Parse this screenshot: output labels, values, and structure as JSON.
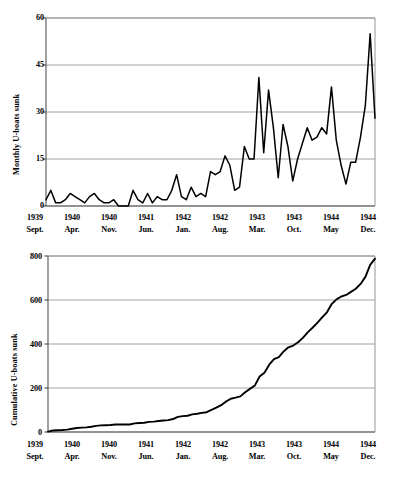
{
  "chart_data": [
    {
      "id": "monthly",
      "type": "line",
      "title": "",
      "xlabel": "",
      "ylabel": "Monthly U-boats sunk",
      "ylim": [
        0,
        60
      ],
      "yticks": [
        0,
        15,
        30,
        45,
        60
      ],
      "grid": true,
      "legend": "none",
      "xtick_labels": [
        {
          "year": "1939",
          "month": "Sept."
        },
        {
          "year": "1940",
          "month": "Apr."
        },
        {
          "year": "1940",
          "month": "Nov."
        },
        {
          "year": "1941",
          "month": "Jun."
        },
        {
          "year": "1942",
          "month": "Jan."
        },
        {
          "year": "1942",
          "month": "Aug."
        },
        {
          "year": "1943",
          "month": "Mar."
        },
        {
          "year": "1943",
          "month": "Oct."
        },
        {
          "year": "1944",
          "month": "May"
        },
        {
          "year": "1944",
          "month": "Dec."
        }
      ],
      "x": [
        "1939 Sept.",
        "1939 Oct.",
        "1939 Nov.",
        "1939 Dec.",
        "1940 Jan.",
        "1940 Feb.",
        "1940 Mar.",
        "1940 Apr.",
        "1940 May",
        "1940 Jun.",
        "1940 Jul.",
        "1940 Aug.",
        "1940 Sept.",
        "1940 Oct.",
        "1940 Nov.",
        "1940 Dec.",
        "1941 Jan.",
        "1941 Feb.",
        "1941 Mar.",
        "1941 Apr.",
        "1941 May",
        "1941 Jun.",
        "1941 Jul.",
        "1941 Aug.",
        "1941 Sept.",
        "1941 Oct.",
        "1941 Nov.",
        "1941 Dec.",
        "1942 Jan.",
        "1942 Feb.",
        "1942 Mar.",
        "1942 Apr.",
        "1942 May",
        "1942 Jun.",
        "1942 Jul.",
        "1942 Aug.",
        "1942 Sept.",
        "1942 Oct.",
        "1942 Nov.",
        "1942 Dec.",
        "1943 Jan.",
        "1943 Feb.",
        "1943 Mar.",
        "1943 Apr.",
        "1943 May",
        "1943 Jun.",
        "1943 Jul.",
        "1943 Aug.",
        "1943 Sept.",
        "1943 Oct.",
        "1943 Nov.",
        "1943 Dec.",
        "1944 Jan.",
        "1944 Feb.",
        "1944 Mar.",
        "1944 Apr.",
        "1944 May",
        "1944 Jun.",
        "1944 Jul.",
        "1944 Aug.",
        "1944 Sept.",
        "1944 Oct.",
        "1944 Nov.",
        "1944 Dec.",
        "1945 Jan.",
        "1945 Feb.",
        "1945 Mar.",
        "1945 Apr.",
        "1945 May"
      ],
      "values": [
        2,
        5,
        1,
        1,
        2,
        4,
        3,
        2,
        1,
        3,
        4,
        2,
        1,
        1,
        2,
        0,
        0,
        0,
        5,
        2,
        1,
        4,
        1,
        3,
        2,
        2,
        5,
        10,
        3,
        2,
        6,
        3,
        4,
        3,
        11,
        10,
        11,
        16,
        13,
        5,
        6,
        19,
        15,
        15,
        41,
        17,
        37,
        25,
        9,
        26,
        19,
        8,
        15,
        20,
        25,
        21,
        22,
        25,
        23,
        38,
        21,
        13,
        7,
        14,
        14,
        22,
        32,
        55,
        28
      ]
    },
    {
      "id": "cumulative",
      "type": "line",
      "title": "",
      "xlabel": "",
      "ylabel": "Cumulative U-boats sunk",
      "ylim": [
        0,
        800
      ],
      "yticks": [
        0,
        200,
        400,
        600,
        800
      ],
      "grid": true,
      "legend": "none",
      "xtick_labels": [
        {
          "year": "1939",
          "month": "Sept."
        },
        {
          "year": "1940",
          "month": "Apr."
        },
        {
          "year": "1940",
          "month": "Nov."
        },
        {
          "year": "1941",
          "month": "Jun."
        },
        {
          "year": "1942",
          "month": "Jan."
        },
        {
          "year": "1942",
          "month": "Aug."
        },
        {
          "year": "1943",
          "month": "Mar."
        },
        {
          "year": "1943",
          "month": "Oct."
        },
        {
          "year": "1944",
          "month": "May"
        },
        {
          "year": "1944",
          "month": "Dec."
        }
      ],
      "x": [
        "1939 Sept.",
        "1939 Oct.",
        "1939 Nov.",
        "1939 Dec.",
        "1940 Jan.",
        "1940 Feb.",
        "1940 Mar.",
        "1940 Apr.",
        "1940 May",
        "1940 Jun.",
        "1940 Jul.",
        "1940 Aug.",
        "1940 Sept.",
        "1940 Oct.",
        "1940 Nov.",
        "1940 Dec.",
        "1941 Jan.",
        "1941 Feb.",
        "1941 Mar.",
        "1941 Apr.",
        "1941 May",
        "1941 Jun.",
        "1941 Jul.",
        "1941 Aug.",
        "1941 Sept.",
        "1941 Oct.",
        "1941 Nov.",
        "1941 Dec.",
        "1942 Jan.",
        "1942 Feb.",
        "1942 Mar.",
        "1942 Apr.",
        "1942 May",
        "1942 Jun.",
        "1942 Jul.",
        "1942 Aug.",
        "1942 Sept.",
        "1942 Oct.",
        "1942 Nov.",
        "1942 Dec.",
        "1943 Jan.",
        "1943 Feb.",
        "1943 Mar.",
        "1943 Apr.",
        "1943 May",
        "1943 Jun.",
        "1943 Jul.",
        "1943 Aug.",
        "1943 Sept.",
        "1943 Oct.",
        "1943 Nov.",
        "1943 Dec.",
        "1944 Jan.",
        "1944 Feb.",
        "1944 Mar.",
        "1944 Apr.",
        "1944 May",
        "1944 Jun.",
        "1944 Jul.",
        "1944 Aug.",
        "1944 Sept.",
        "1944 Oct.",
        "1944 Nov.",
        "1944 Dec.",
        "1945 Jan.",
        "1945 Feb.",
        "1945 Mar.",
        "1945 Apr.",
        "1945 May"
      ],
      "values": [
        2,
        7,
        8,
        9,
        11,
        15,
        18,
        20,
        21,
        24,
        28,
        30,
        31,
        32,
        34,
        34,
        34,
        34,
        39,
        41,
        42,
        46,
        47,
        50,
        52,
        54,
        59,
        69,
        72,
        74,
        80,
        83,
        87,
        90,
        101,
        111,
        122,
        138,
        151,
        156,
        162,
        181,
        196,
        211,
        252,
        269,
        306,
        331,
        340,
        366,
        385,
        393,
        408,
        428,
        453,
        474,
        496,
        521,
        544,
        582,
        603,
        616,
        623,
        637,
        651,
        673,
        705,
        760,
        788
      ]
    }
  ],
  "axes": {
    "monthly": {
      "ylabel": "Monthly U-boats sunk",
      "ytick_labels": [
        "60",
        "45",
        "30",
        "15",
        "0"
      ]
    },
    "cumulative": {
      "ylabel": "Cumulative U-boats sunk",
      "ytick_labels": [
        "800",
        "600",
        "400",
        "200",
        "0"
      ]
    }
  }
}
